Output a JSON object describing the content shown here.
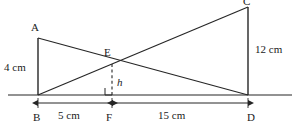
{
  "figure": {
    "type": "geometry-diagram",
    "stroke_color": "#262626",
    "background_color": "#ffffff",
    "points": {
      "A": {
        "label": "A",
        "x": 38,
        "y": 38
      },
      "B": {
        "label": "B",
        "x": 38,
        "y": 95
      },
      "C": {
        "label": "C",
        "x": 248,
        "y": 7
      },
      "D": {
        "label": "D",
        "x": 248,
        "y": 95
      },
      "E": {
        "label": "E",
        "x": 112,
        "y": 63
      },
      "F": {
        "label": "F",
        "x": 112,
        "y": 95
      }
    },
    "measurements": {
      "ab": "4 cm",
      "cd": "12 cm",
      "bf": "5 cm",
      "fd": "15 cm",
      "height": "h"
    }
  }
}
